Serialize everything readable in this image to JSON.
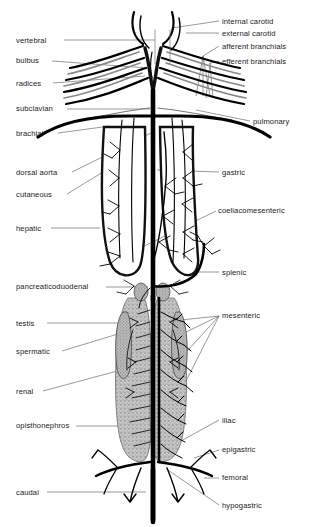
{
  "figure": {
    "type": "anatomical-diagram",
    "colors": {
      "vessel_dark": "#000000",
      "vessel_outline": "#1a1a1a",
      "organ_fill": "#9a9a9a",
      "organ_fill_light": "#b4b4b4",
      "leader_line": "#555555",
      "text": "#1a1a1a",
      "background": "#ffffff"
    }
  },
  "labels": {
    "left": [
      {
        "id": "vertebral",
        "text": "vertebral",
        "x": 16,
        "y": 40
      },
      {
        "id": "bulbus",
        "text": "bulbus",
        "x": 16,
        "y": 60
      },
      {
        "id": "radices",
        "text": "radices",
        "x": 16,
        "y": 83
      },
      {
        "id": "subclavian",
        "text": "subclavian",
        "x": 16,
        "y": 107
      },
      {
        "id": "brachial",
        "text": "brachial",
        "x": 16,
        "y": 133
      },
      {
        "id": "dorsal-aorta",
        "text": "dorsal aorta",
        "x": 16,
        "y": 172
      },
      {
        "id": "cutaneous",
        "text": "cutaneous",
        "x": 16,
        "y": 194
      },
      {
        "id": "hepatic",
        "text": "hepatic",
        "x": 16,
        "y": 228
      },
      {
        "id": "pancreaticoduodenal",
        "text": "pancreaticoduodenal",
        "x": 16,
        "y": 285
      },
      {
        "id": "testis",
        "text": "testis",
        "x": 16,
        "y": 323
      },
      {
        "id": "spermatic",
        "text": "spermatic",
        "x": 16,
        "y": 351
      },
      {
        "id": "renal",
        "text": "renal",
        "x": 16,
        "y": 392
      },
      {
        "id": "opisthonephros",
        "text": "opisthonephros",
        "x": 16,
        "y": 425
      },
      {
        "id": "caudal",
        "text": "caudal",
        "x": 16,
        "y": 492
      }
    ],
    "right": [
      {
        "id": "internal-carotid",
        "text": "internal carotid",
        "x": 222,
        "y": 21
      },
      {
        "id": "external-carotid",
        "text": "external carotid",
        "x": 222,
        "y": 33
      },
      {
        "id": "afferent-branchials",
        "text": "afferent branchials",
        "x": 222,
        "y": 46
      },
      {
        "id": "efferent-branchials",
        "text": "efferent branchials",
        "x": 222,
        "y": 61
      },
      {
        "id": "pulmonary",
        "text": "pulmonary",
        "x": 253,
        "y": 121
      },
      {
        "id": "gastric",
        "text": "gastric",
        "x": 222,
        "y": 172
      },
      {
        "id": "coeliacomesenteric",
        "text": "coeliacomesenteric",
        "x": 218,
        "y": 210
      },
      {
        "id": "splenic",
        "text": "splenic",
        "x": 222,
        "y": 272
      },
      {
        "id": "mesenteric",
        "text": "mesenteric",
        "x": 222,
        "y": 315
      },
      {
        "id": "iliac",
        "text": "iliac",
        "x": 222,
        "y": 420
      },
      {
        "id": "epigastric",
        "text": "epigastric",
        "x": 222,
        "y": 449
      },
      {
        "id": "femoral",
        "text": "femoral",
        "x": 222,
        "y": 477
      },
      {
        "id": "hypogastric",
        "text": "hypogastric",
        "x": 222,
        "y": 505
      }
    ]
  }
}
